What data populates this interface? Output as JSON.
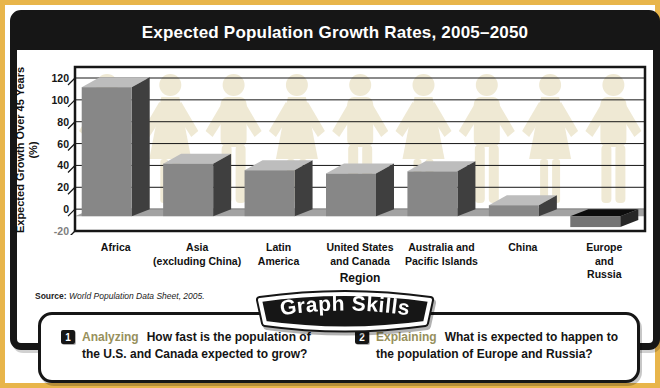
{
  "title": "Expected Population Growth Rates, 2005–2050",
  "chart_data": {
    "type": "bar",
    "title": "Expected Population Growth Rates, 2005–2050",
    "categories": [
      "Africa",
      "Asia\n(excluding China)",
      "Latin\nAmerica",
      "United States\nand Canada",
      "Australia and\nPacific Islands",
      "China",
      "Europe\nand Russia"
    ],
    "values": [
      118,
      48,
      42,
      39,
      41,
      10,
      -10
    ],
    "xlabel": "Region",
    "ylabel": "Expected Growth Over 45 Years",
    "ylabel_unit": "(%)",
    "yticks": [
      120,
      100,
      80,
      60,
      40,
      20,
      0,
      -20
    ],
    "ylim": [
      -20,
      130
    ],
    "grid": true,
    "bar_style": "3d",
    "background_motif": "paper-doll people silhouettes holding hands",
    "source_prefix": "Source:",
    "source_text": " World Population Data Sheet, 2005."
  },
  "graph_skills": {
    "badge": "Graph Skills",
    "questions": [
      {
        "number": "1",
        "label": "Analyzing",
        "text": "How fast is the population of the U.S. and Canada expected to grow?"
      },
      {
        "number": "2",
        "label": "Explaining",
        "text": "What is expected to happen to the population of Europe and Russia?"
      }
    ]
  },
  "colors": {
    "frame_yellow": "#e8b54a",
    "panel_black": "#161616",
    "bar_front": "#878787",
    "bar_top": "#bdbdbd",
    "bar_side": "#3f3f3f",
    "negative_bar_top": "#0c0c0c",
    "floor": "#a2a2a2",
    "silhouette": "#efe9d4",
    "skill_label": "#97905c"
  }
}
